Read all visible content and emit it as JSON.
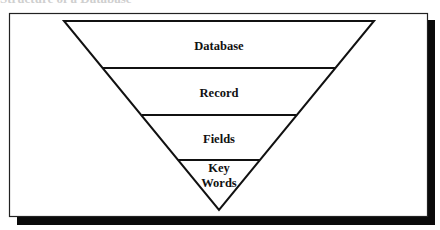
{
  "caption": "Structure of a Database",
  "diagram": {
    "type": "inverted-pyramid",
    "levels": [
      {
        "label": "Database"
      },
      {
        "label": "Record"
      },
      {
        "label": "Fields"
      },
      {
        "label_line1": "Key",
        "label_line2": "Words"
      }
    ]
  },
  "colors": {
    "stroke": "#111111",
    "shadow": "#0a0a0a",
    "background": "#ffffff"
  }
}
